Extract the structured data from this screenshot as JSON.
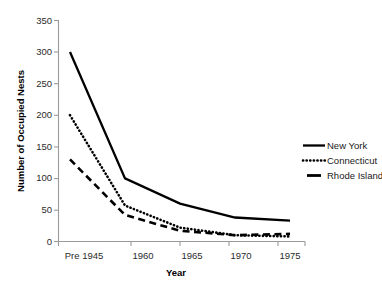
{
  "chart_data": {
    "type": "line",
    "title": "",
    "xlabel": "Year",
    "ylabel": "Number of Occupied Nests",
    "categories": [
      "Pre 1945",
      "1960",
      "1965",
      "1970",
      "1975"
    ],
    "ylim": [
      0,
      350
    ],
    "yticks": [
      0,
      50,
      100,
      150,
      200,
      250,
      300,
      350
    ],
    "grid": false,
    "legend_position": "right",
    "series": [
      {
        "name": "New York",
        "style": "solid",
        "color": "#000000",
        "values": [
          300,
          100,
          60,
          38,
          33
        ]
      },
      {
        "name": "Connecticut",
        "style": "dotted",
        "color": "#000000",
        "values": [
          200,
          57,
          22,
          10,
          8
        ]
      },
      {
        "name": "Rhode Island",
        "style": "dashed",
        "color": "#000000",
        "values": [
          130,
          42,
          17,
          10,
          12
        ]
      }
    ]
  },
  "axes": {
    "y_tick_labels": [
      "0",
      "50",
      "100",
      "150",
      "200",
      "250",
      "300",
      "350"
    ],
    "x_tick_labels": [
      "Pre 1945",
      "1960",
      "1965",
      "1970",
      "1975"
    ],
    "y_title": "Number of Occupied Nests",
    "x_title": "Year"
  },
  "legend": {
    "items": [
      {
        "label": "New York"
      },
      {
        "label": "Connecticut"
      },
      {
        "label": "Rhode Island"
      }
    ]
  }
}
